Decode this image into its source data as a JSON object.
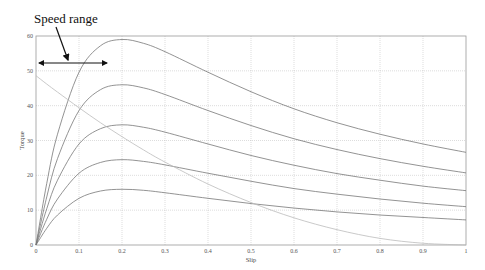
{
  "chart_data": {
    "type": "line",
    "title": "",
    "xlabel": "Slip",
    "ylabel": "Torque",
    "xlim": [
      0,
      1
    ],
    "ylim": [
      0,
      60
    ],
    "grid": true,
    "x_ticks": [
      "0",
      "0.1",
      "0.2",
      "0.3",
      "0.4",
      "0.5",
      "0.6",
      "0.7",
      "0.8",
      "0.9",
      "1"
    ],
    "y_ticks": [
      "0",
      "10",
      "20",
      "30",
      "40",
      "50",
      "60"
    ],
    "x_tick_values": [
      0,
      0.1,
      0.2,
      0.3,
      0.4,
      0.5,
      0.6,
      0.7,
      0.8,
      0.9,
      1
    ],
    "y_tick_values": [
      0,
      10,
      20,
      30,
      40,
      50,
      60
    ],
    "x": [
      0,
      0.025,
      0.05,
      0.1,
      0.15,
      0.2,
      0.25,
      0.3,
      0.4,
      0.5,
      0.6,
      0.7,
      0.8,
      0.9,
      1.0
    ],
    "series": [
      {
        "name": "torque-curve-1",
        "color": "#777777",
        "values": [
          0,
          17.7,
          31.8,
          49.6,
          57.2,
          59,
          57.9,
          55.5,
          49.6,
          44,
          39.1,
          35.1,
          31.8,
          29,
          26.6
        ]
      },
      {
        "name": "torque-curve-2",
        "color": "#777777",
        "values": [
          0,
          13.8,
          24.8,
          38.6,
          44.6,
          46,
          45.1,
          43.2,
          38.6,
          34.3,
          30.5,
          27.4,
          24.8,
          22.6,
          20.7
        ]
      },
      {
        "name": "torque-curve-3",
        "color": "#777777",
        "values": [
          0,
          10.4,
          18.6,
          29,
          33.4,
          34.5,
          33.8,
          32.4,
          29,
          25.7,
          22.9,
          20.5,
          18.6,
          16.9,
          15.6
        ]
      },
      {
        "name": "torque-curve-4",
        "color": "#777777",
        "values": [
          0,
          7.4,
          13.2,
          20.6,
          23.7,
          24.5,
          24,
          23,
          20.6,
          18.3,
          16.2,
          14.6,
          13.2,
          12,
          11
        ]
      },
      {
        "name": "torque-curve-5",
        "color": "#777777",
        "values": [
          0,
          4.8,
          8.6,
          13.4,
          15.5,
          16,
          15.7,
          15,
          13.4,
          11.9,
          10.6,
          9.5,
          8.6,
          7.9,
          7.2
        ]
      },
      {
        "name": "load-curve",
        "color": "#bbbbbb",
        "values": [
          48.6,
          46.2,
          43.9,
          39.4,
          35.1,
          31.1,
          27.3,
          23.8,
          17.5,
          12.2,
          7.8,
          4.4,
          1.9,
          0.5,
          0
        ]
      }
    ],
    "annotations": [
      {
        "text": "Speed range",
        "type": "label-with-arrow",
        "points_to": {
          "x": 0.07,
          "y": 51
        }
      },
      {
        "type": "double-arrow",
        "from": {
          "x": 0,
          "y": 52
        },
        "to": {
          "x": 0.17,
          "y": 52
        }
      }
    ]
  }
}
